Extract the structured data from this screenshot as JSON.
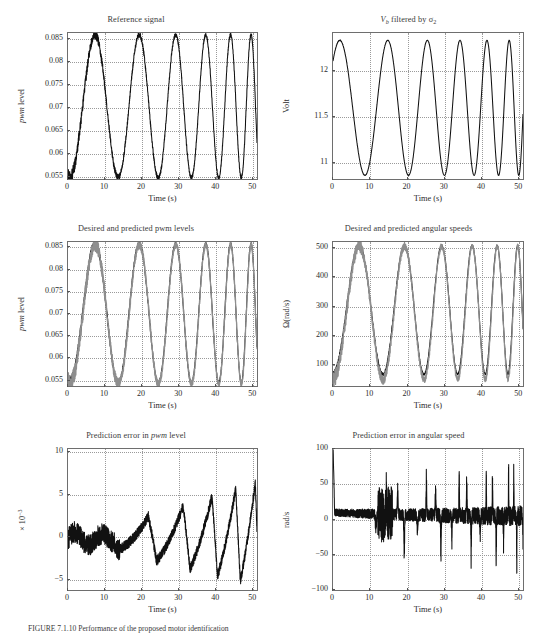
{
  "figure": {
    "caption": "FIGURE 7.1.10   Performance of the proposed motor identification",
    "axis_color": "#6e6e6e",
    "curve_color": "#111111",
    "grid_color": "#9a9a9a",
    "background": "#ffffff"
  },
  "chart_data": [
    {
      "id": "reference-signal",
      "type": "line",
      "title": "Reference signal",
      "title_html": "Reference signal",
      "xlabel": "Time (s)",
      "ylabel": "pwm level",
      "ylabel_html": "<span class=\"it\">pwm</span> level",
      "xlim": [
        0,
        51
      ],
      "ylim": [
        0.0545,
        0.0862
      ],
      "xticks": [
        0,
        10,
        20,
        30,
        40,
        50
      ],
      "yticks": [
        0.055,
        0.06,
        0.065,
        0.07,
        0.075,
        0.08,
        0.085
      ],
      "ytick_labels": [
        "0.055",
        "0.06",
        "0.065",
        "0.07",
        "0.075",
        "0.08",
        "0.085"
      ],
      "grid": true,
      "series": [
        {
          "name": "reference pwm",
          "kind": "chirp",
          "t_start": 0.0,
          "t_end": 51.0,
          "y_min": 0.0548,
          "y_max": 0.0858,
          "start_phase_value": 0.0722,
          "first_peak_t": 7.3,
          "first_trough_t": 14.3,
          "period_start": 14.5,
          "period_end": 4.7,
          "noise_band": 0.0012,
          "noise_decay": 9.0
        }
      ]
    },
    {
      "id": "vb-filtered",
      "type": "line",
      "title": "V_b filtered by sigma_2",
      "title_html": "<span class=\"it\">V</span><span class=\"sub it\">b</span> filtered by &#963;<span class=\"sub\">2</span>",
      "xlabel": "Time (s)",
      "ylabel": "Volt",
      "ylabel_html": "Volt",
      "xlim": [
        0,
        51
      ],
      "ylim": [
        10.82,
        12.42
      ],
      "xticks": [
        0,
        10,
        20,
        30,
        40,
        50
      ],
      "yticks": [
        11,
        11.5,
        12
      ],
      "ytick_labels": [
        "11",
        "11.5",
        "12"
      ],
      "grid": true,
      "series": [
        {
          "name": "battery voltage filtered",
          "kind": "chirp",
          "t_start": 0.0,
          "t_end": 51.0,
          "y_min": 10.86,
          "y_max": 12.34,
          "start_phase_value": 11.97,
          "first_peak_t": 14.7,
          "first_trough_t": 7.2,
          "period_start": 14.5,
          "period_end": 4.7,
          "noise_band": 0.004,
          "noise_decay": 9.0,
          "inverted": true
        }
      ]
    },
    {
      "id": "desired-predicted-pwm",
      "type": "line",
      "title": "Desired and predicted pwm levels",
      "title_html": "Desired and predicted pwm levels",
      "xlabel": "Time (s)",
      "ylabel": "pwm level",
      "ylabel_html": "<span class=\"it\">pwm</span> level",
      "xlim": [
        0,
        51
      ],
      "ylim": [
        0.0538,
        0.0862
      ],
      "xticks": [
        0,
        10,
        20,
        30,
        40,
        50
      ],
      "yticks": [
        0.055,
        0.06,
        0.065,
        0.07,
        0.075,
        0.08,
        0.085
      ],
      "ytick_labels": [
        "0.055",
        "0.06",
        "0.065",
        "0.07",
        "0.075",
        "0.08",
        "0.085"
      ],
      "grid": true,
      "series": [
        {
          "name": "desired pwm",
          "kind": "chirp",
          "t_start": 0.0,
          "t_end": 51.0,
          "y_min": 0.0545,
          "y_max": 0.0858,
          "start_phase_value": 0.0722,
          "first_peak_t": 7.3,
          "first_trough_t": 14.3,
          "period_start": 14.5,
          "period_end": 4.7,
          "noise_band": 0.0011,
          "noise_decay": 9.0
        },
        {
          "name": "predicted pwm",
          "kind": "chirp",
          "t_start": 0.0,
          "t_end": 51.0,
          "y_min": 0.0543,
          "y_max": 0.0856,
          "start_phase_value": 0.0719,
          "first_peak_t": 7.35,
          "first_trough_t": 14.35,
          "period_start": 14.5,
          "period_end": 4.7,
          "noise_band": 0.0017,
          "noise_decay": 14.0,
          "gray": true
        }
      ]
    },
    {
      "id": "desired-predicted-omega",
      "type": "line",
      "title": "Desired and predicted angular speeds",
      "title_html": "Desired and predicted angular speeds",
      "xlabel": "Time (s)",
      "ylabel": "Omega (rad/s)",
      "ylabel_html": "&#937;(rad/s)",
      "xlim": [
        0,
        51
      ],
      "ylim": [
        30,
        520
      ],
      "xticks": [
        0,
        10,
        20,
        30,
        40,
        50
      ],
      "yticks": [
        100,
        200,
        300,
        400,
        500
      ],
      "ytick_labels": [
        "100",
        "200",
        "300",
        "400",
        "500"
      ],
      "grid": true,
      "series": [
        {
          "name": "desired angular speed",
          "kind": "chirp",
          "t_start": 0.0,
          "t_end": 51.0,
          "y_min": 70,
          "y_max": 508,
          "start_phase_value": 362,
          "first_peak_t": 7.0,
          "first_trough_t": 14.6,
          "period_start": 14.8,
          "period_end": 4.7,
          "noise_band": 9,
          "noise_decay": 9.0
        },
        {
          "name": "predicted angular speed",
          "kind": "chirp",
          "t_start": 0.0,
          "t_end": 51.0,
          "y_min": 52,
          "y_max": 506,
          "start_phase_value": 330,
          "first_peak_t": 7.05,
          "first_trough_t": 14.6,
          "period_start": 14.8,
          "period_end": 4.7,
          "noise_band": 22,
          "noise_decay": 14.0,
          "gray": true
        }
      ]
    },
    {
      "id": "prediction-error-pwm",
      "type": "line",
      "title": "Prediction error in pwm level",
      "title_html": "Prediction error in <span class=\"it\">pwm</span> level",
      "xlabel": "Time (s)",
      "ylabel": "x 10^-3",
      "ylabel_html": "&#215; 10<span class=\"sup\">&#8722;3</span>",
      "xlim": [
        0,
        51
      ],
      "ylim": [
        -6.2,
        10.4
      ],
      "xticks": [
        0,
        10,
        20,
        30,
        40,
        50
      ],
      "yticks": [
        -5,
        0,
        5,
        10
      ],
      "ytick_labels": [
        "−5",
        "0",
        "5",
        "10"
      ],
      "grid": true,
      "series": [
        {
          "name": "pwm prediction error",
          "kind": "sawtooth-error",
          "t_start": 0.0,
          "t_end": 51.0,
          "envelope_start": 1.3,
          "envelope_end": 6.5,
          "trough_start": -1.6,
          "trough_end": -5.6,
          "onset_t": 13.0,
          "period_start": 14.5,
          "period_end": 4.7,
          "noise_band": 1.0,
          "noise_band_end": 0.9
        }
      ]
    },
    {
      "id": "prediction-error-omega",
      "type": "line",
      "title": "Prediction error in angular speed",
      "title_html": "Prediction error in angular speed",
      "xlabel": "Time (s)",
      "ylabel": "rad/s",
      "ylabel_html": "rad/s",
      "xlim": [
        0,
        51
      ],
      "ylim": [
        -100,
        100
      ],
      "xticks": [
        0,
        10,
        20,
        30,
        40,
        50
      ],
      "yticks": [
        -100,
        -50,
        0,
        50,
        100
      ],
      "ytick_labels": [
        "−100",
        "−50",
        "0",
        "50",
        "100"
      ],
      "grid": true,
      "series": [
        {
          "name": "angular speed prediction error",
          "kind": "spiky-error",
          "t_start": 0.0,
          "t_end": 51.0,
          "initial_spike": 100,
          "baseline": 6,
          "band_start": 9,
          "band_end": 26,
          "spike_up_start": 30,
          "spike_up_end": 72,
          "spike_dn_start": -28,
          "spike_dn_end": -82,
          "period_start": 14.5,
          "period_end": 4.7
        }
      ]
    }
  ],
  "panels_layout": [
    {
      "id": "reference-signal",
      "left": 0,
      "top": 4,
      "w": 272,
      "h": 205,
      "plot": {
        "x": 67,
        "y": 28,
        "w": 191,
        "h": 148
      }
    },
    {
      "id": "vb-filtered",
      "left": 272,
      "top": 4,
      "w": 273,
      "h": 205,
      "plot": {
        "x": 60,
        "y": 28,
        "w": 192,
        "h": 148
      }
    },
    {
      "id": "desired-predicted-pwm",
      "left": 0,
      "top": 213,
      "w": 272,
      "h": 203,
      "plot": {
        "x": 67,
        "y": 28,
        "w": 191,
        "h": 146
      }
    },
    {
      "id": "desired-predicted-omega",
      "left": 272,
      "top": 213,
      "w": 273,
      "h": 203,
      "plot": {
        "x": 60,
        "y": 28,
        "w": 192,
        "h": 146
      }
    },
    {
      "id": "prediction-error-pwm",
      "left": 0,
      "top": 420,
      "w": 272,
      "h": 200,
      "plot": {
        "x": 67,
        "y": 28,
        "w": 191,
        "h": 143
      }
    },
    {
      "id": "prediction-error-omega",
      "left": 272,
      "top": 420,
      "w": 273,
      "h": 200,
      "plot": {
        "x": 60,
        "y": 28,
        "w": 192,
        "h": 143
      }
    }
  ]
}
